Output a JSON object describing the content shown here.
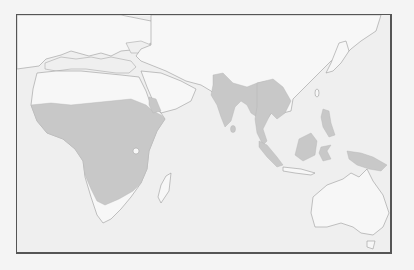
{
  "map": {
    "type": "distribution-range",
    "region": "Old World (Africa, Europe, Asia, Australia)",
    "projection": "equirectangular-like",
    "colors": {
      "background": "#efefef",
      "land": "#f7f7f7",
      "range_fill": "#c8c8c8",
      "coastline": "#9a9a9a",
      "frame": "#555555"
    },
    "range_areas": [
      "Sub-Saharan Africa (excluding southern tip)",
      "Southern Arabian Peninsula coast",
      "Indian subcontinent",
      "Sri Lanka",
      "Mainland Southeast Asia",
      "Borneo",
      "Sulawesi",
      "Philippines",
      "Sumatra",
      "New Guinea"
    ],
    "unshaded_areas": [
      "Europe",
      "North Africa / Sahara",
      "Middle East",
      "China",
      "Japan",
      "Madagascar",
      "Southern tip of Africa",
      "Australia"
    ]
  }
}
